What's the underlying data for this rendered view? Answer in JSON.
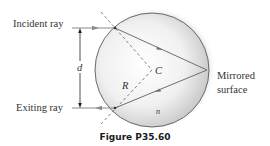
{
  "figure": {
    "caption": "Figure P35.60",
    "labels": {
      "incident_ray": "Incident ray",
      "exiting_ray": "Exiting ray",
      "distance": "d",
      "radius": "R",
      "center": "C",
      "index": "n",
      "mirrored_line1": "Mirrored",
      "mirrored_line2": "surface"
    },
    "colors": {
      "ray": "#6e6e78",
      "outline": "#555555",
      "sphere_fill_light": "#ffffff",
      "sphere_fill_dark": "#c8c8c8",
      "text": "#333333"
    }
  }
}
